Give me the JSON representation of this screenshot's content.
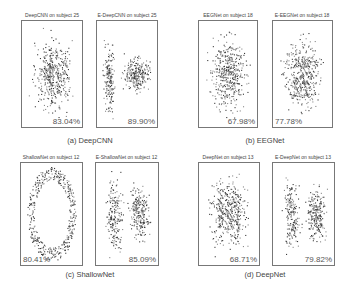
{
  "chart_data": [
    {
      "type": "scatter",
      "id": "a",
      "caption": "(a) DeepCNN",
      "subplots": [
        {
          "title": "DeepCNN on subject 25",
          "accuracy": "83.04%",
          "accuracy_pos": "bottom-right",
          "shape": "diffuse-blob"
        },
        {
          "title": "E-DeepCNN on subject 25",
          "accuracy": "89.90%",
          "accuracy_pos": "bottom-right",
          "shape": "vertical-strip-plus-right-cluster"
        }
      ]
    },
    {
      "type": "scatter",
      "id": "b",
      "caption": "(b) EEGNet",
      "subplots": [
        {
          "title": "EEGNet on subject 18",
          "accuracy": "67.98%",
          "accuracy_pos": "bottom-right",
          "shape": "diffuse-blob"
        },
        {
          "title": "E-EEGNet on subject 18",
          "accuracy": "77.78%",
          "accuracy_pos": "bottom-left",
          "shape": "diffuse-blob"
        }
      ]
    },
    {
      "type": "scatter",
      "id": "c",
      "caption": "(c) ShallowNet",
      "subplots": [
        {
          "title": "ShallowNet on subject 12",
          "accuracy": "80.41%",
          "accuracy_pos": "bottom-left",
          "shape": "ring"
        },
        {
          "title": "E-ShallowNet on subject 12",
          "accuracy": "85.09%",
          "accuracy_pos": "bottom-right",
          "shape": "two-clusters"
        }
      ]
    },
    {
      "type": "scatter",
      "id": "d",
      "caption": "(d) DeepNet",
      "subplots": [
        {
          "title": "DeepNet on subject 13",
          "accuracy": "68.71%",
          "accuracy_pos": "bottom-right",
          "shape": "diffuse-blob"
        },
        {
          "title": "E-DeepNet on subject 13",
          "accuracy": "79.82%",
          "accuracy_pos": "bottom-right",
          "shape": "two-clusters"
        }
      ]
    }
  ],
  "colors": {
    "points_dark": "#3a3a3a",
    "points_light": "#8a8a8a",
    "border": "#777777"
  }
}
